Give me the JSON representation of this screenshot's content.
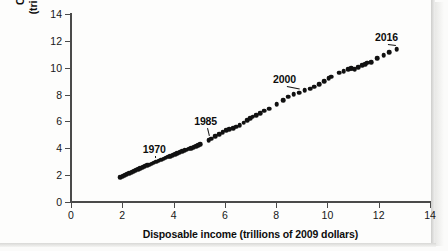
{
  "figure": {
    "x_axis_title": "Disposable income (trillions of 2009 dollars)",
    "y_axis_title_line1": "Consumer spending",
    "y_axis_title_line2": "(trillions of 2009 dollars)"
  },
  "chart_data": {
    "type": "scatter",
    "title": "",
    "xlabel": "Disposable income (trillions of 2009 dollars)",
    "ylabel": "Consumer spending (trillions of 2009 dollars)",
    "xlim": [
      0,
      14
    ],
    "ylim": [
      0,
      14
    ],
    "xticks": [
      0,
      2,
      4,
      6,
      8,
      10,
      12,
      14
    ],
    "yticks": [
      0,
      2,
      4,
      6,
      8,
      10,
      12,
      14
    ],
    "grid": false,
    "legend": "none",
    "marker_color": "#111111",
    "points": [
      {
        "x": 1.93,
        "y": 1.84
      },
      {
        "x": 2.02,
        "y": 1.92
      },
      {
        "x": 2.1,
        "y": 1.99
      },
      {
        "x": 2.18,
        "y": 2.05
      },
      {
        "x": 2.27,
        "y": 2.13
      },
      {
        "x": 2.36,
        "y": 2.21
      },
      {
        "x": 2.45,
        "y": 2.29
      },
      {
        "x": 2.53,
        "y": 2.36
      },
      {
        "x": 2.62,
        "y": 2.44
      },
      {
        "x": 2.7,
        "y": 2.51
      },
      {
        "x": 2.79,
        "y": 2.58
      },
      {
        "x": 2.88,
        "y": 2.66
      },
      {
        "x": 2.97,
        "y": 2.73
      },
      {
        "x": 3.05,
        "y": 2.79
      },
      {
        "x": 3.14,
        "y": 2.86
      },
      {
        "x": 3.22,
        "y": 2.92
      },
      {
        "x": 3.32,
        "y": 2.99
      },
      {
        "x": 3.42,
        "y": 3.07
      },
      {
        "x": 3.52,
        "y": 3.15
      },
      {
        "x": 3.61,
        "y": 3.22
      },
      {
        "x": 3.7,
        "y": 3.29
      },
      {
        "x": 3.79,
        "y": 3.36
      },
      {
        "x": 3.88,
        "y": 3.43
      },
      {
        "x": 3.97,
        "y": 3.5
      },
      {
        "x": 4.06,
        "y": 3.57
      },
      {
        "x": 4.15,
        "y": 3.64
      },
      {
        "x": 4.24,
        "y": 3.7
      },
      {
        "x": 4.33,
        "y": 3.77
      },
      {
        "x": 4.43,
        "y": 3.84
      },
      {
        "x": 4.52,
        "y": 3.9
      },
      {
        "x": 4.6,
        "y": 3.96
      },
      {
        "x": 4.69,
        "y": 4.01
      },
      {
        "x": 4.78,
        "y": 4.07
      },
      {
        "x": 4.88,
        "y": 4.14
      },
      {
        "x": 4.97,
        "y": 4.22
      },
      {
        "x": 5.05,
        "y": 4.3
      },
      {
        "x": 5.37,
        "y": 4.58
      },
      {
        "x": 5.46,
        "y": 4.7
      },
      {
        "x": 5.62,
        "y": 4.88
      },
      {
        "x": 5.78,
        "y": 5.05
      },
      {
        "x": 5.92,
        "y": 5.19
      },
      {
        "x": 6.05,
        "y": 5.33
      },
      {
        "x": 6.18,
        "y": 5.42
      },
      {
        "x": 6.32,
        "y": 5.51
      },
      {
        "x": 6.45,
        "y": 5.6
      },
      {
        "x": 6.58,
        "y": 5.71
      },
      {
        "x": 6.74,
        "y": 5.92
      },
      {
        "x": 6.88,
        "y": 6.08
      },
      {
        "x": 6.99,
        "y": 6.22
      },
      {
        "x": 7.09,
        "y": 6.35
      },
      {
        "x": 7.22,
        "y": 6.48
      },
      {
        "x": 7.38,
        "y": 6.62
      },
      {
        "x": 7.54,
        "y": 6.79
      },
      {
        "x": 7.72,
        "y": 6.95
      },
      {
        "x": 8.02,
        "y": 7.28
      },
      {
        "x": 8.28,
        "y": 7.6
      },
      {
        "x": 8.47,
        "y": 7.83
      },
      {
        "x": 8.69,
        "y": 8.01
      },
      {
        "x": 8.9,
        "y": 8.15
      },
      {
        "x": 9.12,
        "y": 8.33
      },
      {
        "x": 9.32,
        "y": 8.45
      },
      {
        "x": 9.49,
        "y": 8.6
      },
      {
        "x": 9.67,
        "y": 8.77
      },
      {
        "x": 9.88,
        "y": 9.0
      },
      {
        "x": 10.05,
        "y": 9.22
      },
      {
        "x": 10.15,
        "y": 9.32
      },
      {
        "x": 10.46,
        "y": 9.62
      },
      {
        "x": 10.63,
        "y": 9.76
      },
      {
        "x": 10.8,
        "y": 9.88
      },
      {
        "x": 10.88,
        "y": 9.92
      },
      {
        "x": 10.93,
        "y": 9.95
      },
      {
        "x": 10.99,
        "y": 9.92
      },
      {
        "x": 11.06,
        "y": 9.9
      },
      {
        "x": 11.2,
        "y": 10.04
      },
      {
        "x": 11.35,
        "y": 10.18
      },
      {
        "x": 11.48,
        "y": 10.25
      },
      {
        "x": 11.56,
        "y": 10.36
      },
      {
        "x": 11.7,
        "y": 10.43
      },
      {
        "x": 11.93,
        "y": 10.72
      },
      {
        "x": 12.2,
        "y": 10.95
      },
      {
        "x": 12.42,
        "y": 11.15
      },
      {
        "x": 12.7,
        "y": 11.4
      }
    ],
    "annotations": [
      {
        "label": "1970",
        "label_x": 3.25,
        "label_y": 3.98,
        "point_x": 3.33,
        "point_y": 3.01
      },
      {
        "label": "1985",
        "label_y": 6.02,
        "label_x": 5.25,
        "point_x": 5.4,
        "point_y": 4.63
      },
      {
        "label": "2000",
        "label_x": 8.33,
        "label_y": 9.15,
        "point_x": 8.9,
        "point_y": 8.15
      },
      {
        "label": "2016",
        "label_x": 12.3,
        "label_y": 12.3,
        "point_x": 12.7,
        "point_y": 11.4
      }
    ]
  }
}
